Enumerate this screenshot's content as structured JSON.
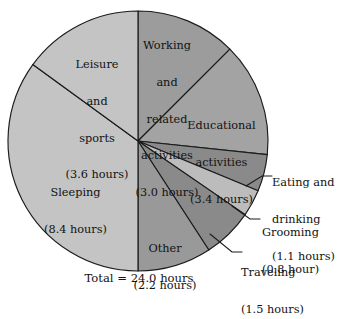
{
  "chart_data": {
    "type": "pie",
    "title": "",
    "subtitle": "",
    "unit": "hours",
    "total_label": "Total = 24.0 hours",
    "total_value": 24.0,
    "start_angle_deg": 0,
    "direction": "clockwise",
    "legend": "none",
    "grid": false,
    "categories": [
      "Working and related activities",
      "Educational activities",
      "Eating and drinking",
      "Grooming",
      "Traveling",
      "Other",
      "Sleeping",
      "Leisure and sports"
    ],
    "values": [
      3.0,
      3.4,
      1.1,
      0.8,
      1.5,
      2.2,
      8.4,
      3.6
    ],
    "slices": [
      {
        "name": "working-and-related-activities",
        "label_lines": [
          "Working",
          "and",
          "related",
          "activities",
          "(3.0 hours)"
        ],
        "value": 3.0,
        "value_text": "3.0 hours",
        "percent": 12.5,
        "angle_deg": 45.0,
        "start_deg": 0.0,
        "end_deg": 45.0,
        "color": "#9c9c9c",
        "label_placement": "inside"
      },
      {
        "name": "educational-activities",
        "label_lines": [
          "Educational",
          "activities",
          "(3.4 hours)"
        ],
        "value": 3.4,
        "value_text": "3.4 hours",
        "percent": 14.17,
        "angle_deg": 51.0,
        "start_deg": 45.0,
        "end_deg": 96.0,
        "color": "#a3a3a3",
        "label_placement": "inside"
      },
      {
        "name": "eating-and-drinking",
        "label_lines": [
          "Eating and",
          "drinking",
          "(1.1 hours)"
        ],
        "value": 1.1,
        "value_text": "1.1 hours",
        "percent": 4.58,
        "angle_deg": 16.5,
        "start_deg": 96.0,
        "end_deg": 112.5,
        "color": "#8a8a8a",
        "label_placement": "outside"
      },
      {
        "name": "grooming",
        "label_lines": [
          "Grooming",
          "(0.8 hour)"
        ],
        "value": 0.8,
        "value_text": "0.8 hour",
        "percent": 3.33,
        "angle_deg": 12.0,
        "start_deg": 112.5,
        "end_deg": 124.5,
        "color": "#bcbcbc",
        "label_placement": "outside"
      },
      {
        "name": "traveling",
        "label_lines": [
          "Traveling",
          "(1.5 hours)"
        ],
        "value": 1.5,
        "value_text": "1.5 hours",
        "percent": 6.25,
        "angle_deg": 22.5,
        "start_deg": 124.5,
        "end_deg": 147.0,
        "color": "#8a8a8a",
        "label_placement": "outside"
      },
      {
        "name": "other",
        "label_lines": [
          "Other",
          "(2.2 hours)"
        ],
        "value": 2.2,
        "value_text": "2.2 hours",
        "percent": 9.17,
        "angle_deg": 33.0,
        "start_deg": 147.0,
        "end_deg": 180.0,
        "color": "#999999",
        "label_placement": "inside"
      },
      {
        "name": "sleeping",
        "label_lines": [
          "Sleeping",
          "(8.4 hours)"
        ],
        "value": 8.4,
        "value_text": "8.4 hours",
        "percent": 35.0,
        "angle_deg": 126.0,
        "start_deg": 180.0,
        "end_deg": 306.0,
        "color": "#c4c4c4",
        "label_placement": "inside"
      },
      {
        "name": "leisure-and-sports",
        "label_lines": [
          "Leisure",
          "and",
          "sports",
          "(3.6 hours)"
        ],
        "value": 3.6,
        "value_text": "3.6 hours",
        "percent": 15.0,
        "angle_deg": 54.0,
        "start_deg": 306.0,
        "end_deg": 360.0,
        "color": "#c4c4c4",
        "label_placement": "inside"
      }
    ],
    "geometry": {
      "center_x": 138,
      "center_y": 141,
      "radius": 130
    },
    "colors": {
      "outline": "#1b1b1b",
      "background": "#ffffff",
      "text": "#121212"
    }
  },
  "labels": {
    "working": {
      "l1": "Working",
      "l2": "and",
      "l3": "related",
      "l4": "activities",
      "l5": "(3.0 hours)"
    },
    "leisure": {
      "l1": "Leisure",
      "l2": "and",
      "l3": "sports",
      "l4": "(3.6 hours)"
    },
    "educational": {
      "l1": "Educational",
      "l2": "activities",
      "l3": "(3.4 hours)"
    },
    "sleeping": {
      "l1": "Sleeping",
      "l2": "(8.4 hours)"
    },
    "other": {
      "l1": "Other",
      "l2": "(2.2 hours)"
    },
    "eating": {
      "l1": "Eating and",
      "l2": "drinking",
      "l3": "(1.1 hours)"
    },
    "grooming": {
      "l1": "Grooming",
      "l2": "(0.8 hour)"
    },
    "traveling": {
      "l1": "Traveling",
      "l2": "(1.5 hours)"
    }
  },
  "caption": {
    "total": "Total = 24.0 hours"
  }
}
